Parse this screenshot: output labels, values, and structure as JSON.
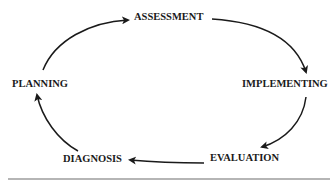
{
  "diagram": {
    "type": "cycle",
    "nodes": [
      {
        "id": "assessment",
        "label": "ASSESSMENT"
      },
      {
        "id": "implementing",
        "label": "IMPLEMENTING"
      },
      {
        "id": "evaluation",
        "label": "EVALUATION"
      },
      {
        "id": "diagnosis",
        "label": "DIAGNOSIS"
      },
      {
        "id": "planning",
        "label": "PLANNING"
      }
    ],
    "edges": [
      {
        "from": "assessment",
        "to": "implementing"
      },
      {
        "from": "implementing",
        "to": "evaluation"
      },
      {
        "from": "evaluation",
        "to": "diagnosis"
      },
      {
        "from": "diagnosis",
        "to": "planning"
      },
      {
        "from": "planning",
        "to": "assessment"
      }
    ],
    "colors": {
      "text": "#1a1a1a",
      "arrow": "#1a1a1a",
      "rule": "#b5b5b5"
    }
  }
}
